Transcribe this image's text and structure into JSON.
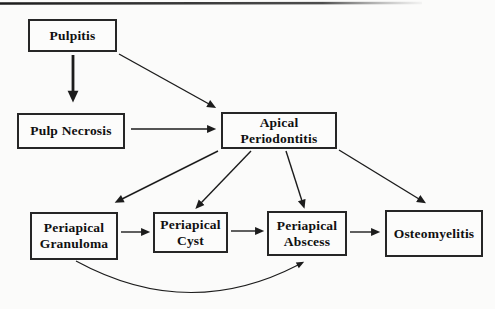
{
  "diagram": {
    "nodes": {
      "pulpitis": {
        "lines": [
          "Pulpitis"
        ]
      },
      "pulp_necrosis": {
        "lines": [
          "Pulp Necrosis"
        ]
      },
      "apical_periodontitis": {
        "lines": [
          "Apical",
          "Periodontitis"
        ]
      },
      "periapical_granuloma": {
        "lines": [
          "Periapical",
          "Granuloma"
        ]
      },
      "periapical_cyst": {
        "lines": [
          "Periapical",
          "Cyst"
        ]
      },
      "periapical_abscess": {
        "lines": [
          "Periapical",
          "Abscess"
        ]
      },
      "osteomyelitis": {
        "lines": [
          "Osteomyelitis"
        ]
      }
    },
    "edges": [
      {
        "from": "pulpitis",
        "to": "pulp_necrosis",
        "style": "thick"
      },
      {
        "from": "pulpitis",
        "to": "apical_periodontitis",
        "style": "thin"
      },
      {
        "from": "pulp_necrosis",
        "to": "apical_periodontitis",
        "style": "thin"
      },
      {
        "from": "apical_periodontitis",
        "to": "periapical_granuloma",
        "style": "thin"
      },
      {
        "from": "apical_periodontitis",
        "to": "periapical_cyst",
        "style": "thin"
      },
      {
        "from": "apical_periodontitis",
        "to": "periapical_abscess",
        "style": "thin"
      },
      {
        "from": "apical_periodontitis",
        "to": "osteomyelitis",
        "style": "thin"
      },
      {
        "from": "periapical_granuloma",
        "to": "periapical_cyst",
        "style": "thin"
      },
      {
        "from": "periapical_cyst",
        "to": "periapical_abscess",
        "style": "thin"
      },
      {
        "from": "periapical_abscess",
        "to": "osteomyelitis",
        "style": "thin"
      },
      {
        "from": "periapical_granuloma",
        "to": "periapical_abscess",
        "style": "curved"
      }
    ],
    "colors": {
      "line": "#1c1c1c",
      "box_border": "#262626",
      "box_fill": "#fcfcfb",
      "background": "#fbfbfa",
      "text": "#101010"
    }
  }
}
